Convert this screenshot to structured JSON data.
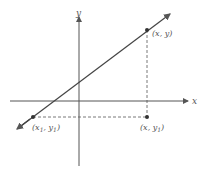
{
  "diagram": {
    "type": "coordinate-plane-line",
    "axes": {
      "x_label": "x",
      "y_label": "y"
    },
    "points": [
      {
        "id": "p1",
        "label": "(x₁, y₁)",
        "label_html": "(x<tspan font-size='6' dy='2'>1</tspan><tspan dy='-2'>, y</tspan><tspan font-size='6' dy='2'>1</tspan><tspan dy='-2'>)</tspan>"
      },
      {
        "id": "p2",
        "label": "(x, y)"
      },
      {
        "id": "p3",
        "label": "(x, y₁)"
      }
    ],
    "colors": {
      "line": "#444444",
      "axis": "#555555",
      "dashed": "#555555",
      "point": "#333333"
    }
  }
}
